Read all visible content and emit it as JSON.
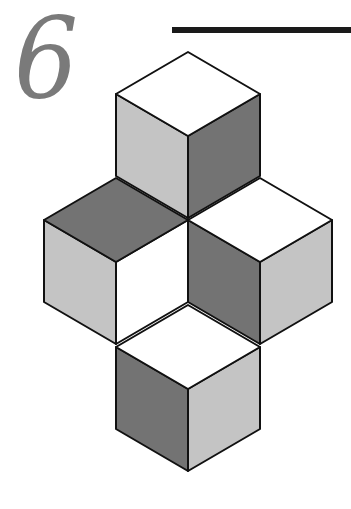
{
  "figure": {
    "chapter_number": "6",
    "colors": {
      "white": "#ffffff",
      "light": "#c4c4c4",
      "dark": "#737373",
      "numeral": "#7a7a7a",
      "rule": "#1a1a1a",
      "outline": "#111111"
    },
    "cubes": [
      {
        "name": "top-cube",
        "faces": {
          "top": "white",
          "left": "light",
          "right": "dark"
        }
      },
      {
        "name": "left-cube",
        "faces": {
          "top": "dark",
          "left": "light",
          "right": "white"
        }
      },
      {
        "name": "right-cube",
        "faces": {
          "top": "white",
          "left": "dark",
          "right": "light"
        }
      },
      {
        "name": "bottom-cube",
        "faces": {
          "top": "white",
          "left": "dark",
          "right": "light"
        }
      }
    ]
  }
}
